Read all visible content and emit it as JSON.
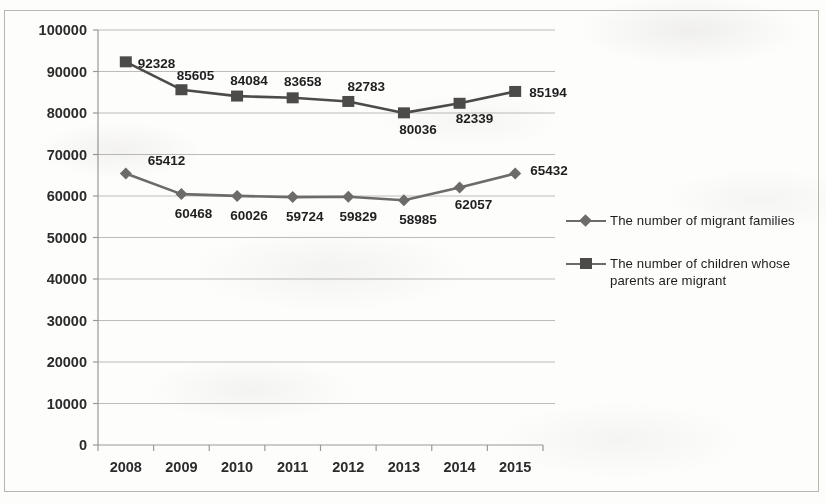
{
  "chart_data": {
    "type": "line",
    "title": "",
    "subtitle": "",
    "xlabel": "",
    "ylabel": "",
    "categories": [
      "2008",
      "2009",
      "2010",
      "2011",
      "2012",
      "2013",
      "2014",
      "2015"
    ],
    "ylim": [
      0,
      100000
    ],
    "ytick_step": 10000,
    "yticks": [
      "0",
      "10000",
      "20000",
      "30000",
      "40000",
      "50000",
      "60000",
      "70000",
      "80000",
      "90000",
      "100000"
    ],
    "grid": true,
    "grid_axis": "y",
    "legend_position": "right",
    "series": [
      {
        "name": "The number of migrant families",
        "marker": "diamond",
        "color": "#6d6b68",
        "values": [
          65412,
          60468,
          60026,
          59724,
          59829,
          58985,
          62057,
          65432
        ],
        "labels": [
          "65412",
          "60468",
          "60026",
          "59724",
          "59829",
          "58985",
          "62057",
          "65432"
        ]
      },
      {
        "name": "The number of children whose parents are migrant",
        "marker": "square",
        "color": "#4d4b49",
        "values": [
          92328,
          85605,
          84084,
          83658,
          82783,
          80036,
          82339,
          85194
        ],
        "labels": [
          "92328",
          "85605",
          "84084",
          "83658",
          "82783",
          "80036",
          "82339",
          "85194"
        ]
      }
    ]
  },
  "legend": {
    "items": [
      {
        "label": "The number of migrant families",
        "marker": "diamond"
      },
      {
        "label": "The number of children whose parents are migrant",
        "marker": "square"
      }
    ]
  },
  "colors": {
    "series_families": "#6d6b68",
    "series_children": "#4d4b49",
    "gridline": "#bfbcb7",
    "axis": "#9c9994",
    "text": "#1f1f1f",
    "background": "#fdfdfc"
  }
}
